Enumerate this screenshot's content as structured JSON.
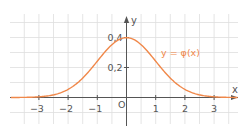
{
  "chart_data": {
    "type": "line",
    "title": "",
    "xlabel": "x",
    "ylabel": "y",
    "origin_label": "O",
    "curve_label": "y = φ(x)",
    "function": "standard normal density φ(x) = (1/√(2π))·e^(-x²/2)",
    "xlim": [
      -4.0,
      4.0
    ],
    "ylim": [
      -0.07,
      0.5
    ],
    "grid": true,
    "grid_step_x": 0.5,
    "grid_step_y": 0.1,
    "x_ticks": [
      -3,
      -2,
      -1,
      1,
      2,
      3
    ],
    "x_tick_labels": [
      "−3",
      "−2",
      "−1",
      "1",
      "2",
      "3"
    ],
    "y_ticks": [
      0.2,
      0.4
    ],
    "y_tick_labels": [
      "0,2",
      "0,4"
    ],
    "series": [
      {
        "name": "y = φ(x)",
        "color": "#f0884a",
        "x": [
          -4,
          -3.5,
          -3,
          -2.5,
          -2,
          -1.5,
          -1,
          -0.5,
          0,
          0.5,
          1,
          1.5,
          2,
          2.5,
          3,
          3.5,
          4
        ],
        "values": [
          0.0001,
          0.0009,
          0.0044,
          0.0175,
          0.054,
          0.1295,
          0.242,
          0.3521,
          0.3989,
          0.3521,
          0.242,
          0.1295,
          0.054,
          0.0175,
          0.0044,
          0.0009,
          0.0001
        ]
      }
    ]
  },
  "colors": {
    "curve": "#f0884a",
    "axis": "#555555",
    "grid": "#dedede",
    "text": "#555555"
  }
}
